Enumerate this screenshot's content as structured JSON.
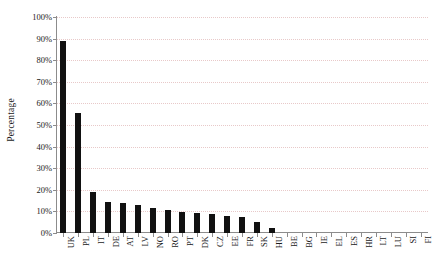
{
  "chart_data": {
    "type": "bar",
    "title": "",
    "subtitle": "",
    "xlabel": "",
    "ylabel": "Percentage",
    "ylim": [
      0,
      100
    ],
    "ytick_labels": [
      "100%",
      "90%",
      "80%",
      "70%",
      "60%",
      "50%",
      "40%",
      "30%",
      "20%",
      "10%",
      "0%"
    ],
    "ytick_values": [
      100,
      90,
      80,
      70,
      60,
      50,
      40,
      30,
      20,
      10,
      0
    ],
    "grid": "horizontal-dotted",
    "legend": "none",
    "bar_color": "#111111",
    "grid_color": "#e8c9c9",
    "axis_color": "#8c8c8c",
    "categories": [
      "UK",
      "PL",
      "IT",
      "DE",
      "AT",
      "LV",
      "NO",
      "RO",
      "PT",
      "DK",
      "CZ",
      "EE",
      "FR",
      "SK",
      "HU",
      "BE",
      "BG",
      "IE",
      "EL",
      "ES",
      "HR",
      "LT",
      "LU",
      "SI",
      "FI"
    ],
    "values": [
      89,
      55.5,
      19,
      14.3,
      13.9,
      13,
      11.6,
      10.6,
      9.8,
      9.2,
      8.7,
      7.9,
      7.4,
      5.1,
      2.3,
      0,
      0,
      0,
      0,
      0,
      0,
      0,
      0,
      0,
      0
    ],
    "unit": "%"
  }
}
